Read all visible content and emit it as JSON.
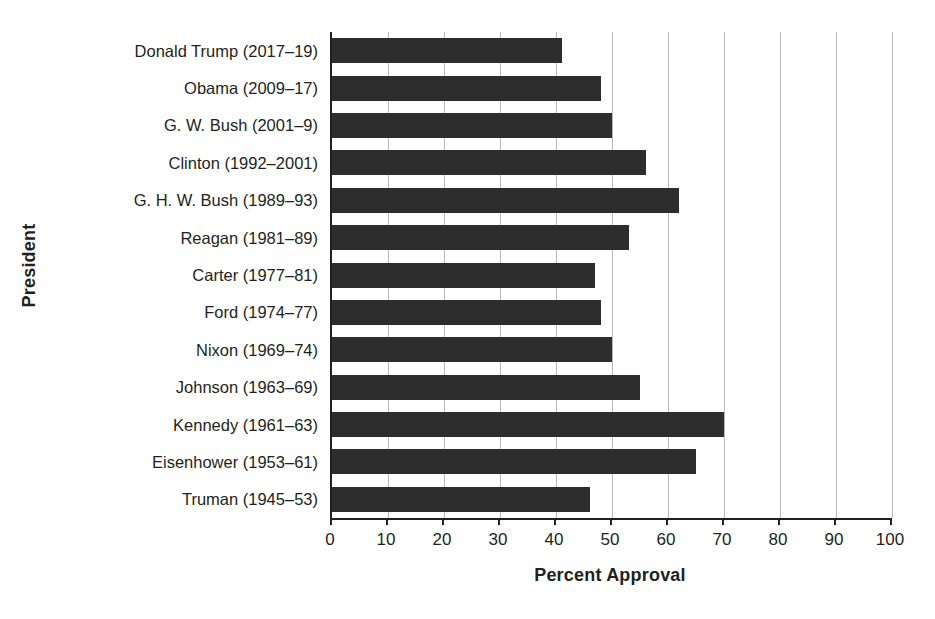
{
  "chart_data": {
    "type": "bar",
    "orientation": "horizontal",
    "title": "",
    "xlabel": "Percent Approval",
    "ylabel": "President",
    "xlim": [
      0,
      100
    ],
    "xticks": [
      0,
      10,
      20,
      30,
      40,
      50,
      60,
      70,
      80,
      90,
      100
    ],
    "grid": "vertical-only",
    "legend": "none",
    "bar_color": "#2d2d2d",
    "gridline_color": "#b9b9b9",
    "axis_color": "#231f20",
    "categories": [
      "Donald Trump (2017–19)",
      "Obama (2009–17)",
      "G. W. Bush (2001–9)",
      "Clinton (1992–2001)",
      "G. H. W. Bush (1989–93)",
      "Reagan (1981–89)",
      "Carter (1977–81)",
      "Ford (1974–77)",
      "Nixon (1969–74)",
      "Johnson (1963–69)",
      "Kennedy (1961–63)",
      "Eisenhower (1953–61)",
      "Truman (1945–53)"
    ],
    "values": [
      41,
      48,
      50,
      56,
      62,
      53,
      47,
      48,
      50,
      55,
      70,
      65,
      46
    ]
  }
}
